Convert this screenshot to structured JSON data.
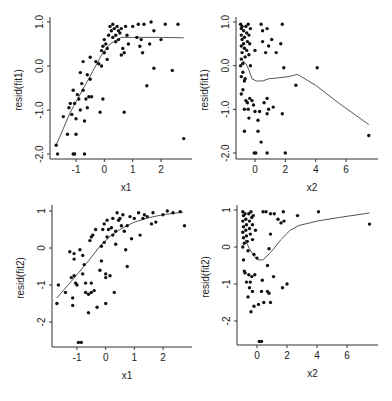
{
  "chart_data": [
    {
      "id": "p1",
      "type": "scatter",
      "xlabel": "x1",
      "ylabel": "resid(fit1)",
      "xlim": [
        -1.9,
        2.9
      ],
      "ylim": [
        -2.1,
        1.05
      ],
      "xticks": [
        -1,
        0,
        1,
        2
      ],
      "xtick_labels": [
        "-1",
        "0",
        "1",
        "2"
      ],
      "yticks": [
        -2,
        -1,
        0,
        1
      ],
      "ytick_labels": [
        "-2.0",
        "-1.0",
        "0.0",
        "1.0"
      ],
      "points": [
        [
          -1.7,
          -1.8
        ],
        [
          -1.65,
          -2.0
        ],
        [
          -1.45,
          -1.15
        ],
        [
          -1.3,
          -1.55
        ],
        [
          -1.25,
          -0.95
        ],
        [
          -1.2,
          -0.85
        ],
        [
          -1.15,
          -1.1
        ],
        [
          -1.1,
          -0.55
        ],
        [
          -1.1,
          -2.0
        ],
        [
          -1.05,
          -2.0
        ],
        [
          -1.05,
          -0.85
        ],
        [
          -1.0,
          -1.2
        ],
        [
          -1.0,
          -1.55
        ],
        [
          -0.95,
          -0.65
        ],
        [
          -0.9,
          -0.75
        ],
        [
          -0.85,
          -1.0
        ],
        [
          -0.85,
          -0.15
        ],
        [
          -0.8,
          -0.4
        ],
        [
          -0.75,
          -0.55
        ],
        [
          -0.75,
          0.1
        ],
        [
          -0.7,
          -1.25
        ],
        [
          -0.7,
          -2.0
        ],
        [
          -0.65,
          -0.75
        ],
        [
          -0.6,
          -0.2
        ],
        [
          -0.6,
          -0.95
        ],
        [
          -0.55,
          -0.7
        ],
        [
          -0.5,
          -0.3
        ],
        [
          -0.5,
          0.2
        ],
        [
          -0.45,
          -0.7
        ],
        [
          -0.3,
          0.1
        ],
        [
          -0.2,
          0.05
        ],
        [
          -0.15,
          -1.05
        ],
        [
          -0.1,
          0.35
        ],
        [
          -0.1,
          0.0
        ],
        [
          -0.05,
          0.45
        ],
        [
          -0.05,
          -0.75
        ],
        [
          0.0,
          0.3
        ],
        [
          0.0,
          0.6
        ],
        [
          0.05,
          0.5
        ],
        [
          0.1,
          0.15
        ],
        [
          0.1,
          0.4
        ],
        [
          0.15,
          0.7
        ],
        [
          0.2,
          0.9
        ],
        [
          0.25,
          0.8
        ],
        [
          0.3,
          0.95
        ],
        [
          0.3,
          0.65
        ],
        [
          0.35,
          0.85
        ],
        [
          0.4,
          0.7
        ],
        [
          0.4,
          0.55
        ],
        [
          0.45,
          0.9
        ],
        [
          0.5,
          0.6
        ],
        [
          0.5,
          0.8
        ],
        [
          0.55,
          0.75
        ],
        [
          0.6,
          0.25
        ],
        [
          0.6,
          0.85
        ],
        [
          0.65,
          0.4
        ],
        [
          0.7,
          0.3
        ],
        [
          0.7,
          -1.05
        ],
        [
          0.75,
          0.9
        ],
        [
          0.8,
          0.7
        ],
        [
          0.85,
          0.5
        ],
        [
          1.0,
          0.9
        ],
        [
          1.15,
          0.65
        ],
        [
          1.2,
          0.95
        ],
        [
          1.25,
          0.45
        ],
        [
          1.3,
          0.6
        ],
        [
          1.35,
          0.3
        ],
        [
          1.4,
          0.95
        ],
        [
          1.5,
          -0.45
        ],
        [
          1.6,
          0.5
        ],
        [
          1.65,
          1.0
        ],
        [
          1.75,
          0.8
        ],
        [
          1.75,
          -0.05
        ],
        [
          2.0,
          0.6
        ],
        [
          2.15,
          0.95
        ],
        [
          2.4,
          -0.1
        ],
        [
          2.6,
          0.95
        ],
        [
          2.8,
          -1.65
        ]
      ],
      "smooth": [
        [
          -1.7,
          -1.8
        ],
        [
          -1.2,
          -1.05
        ],
        [
          -0.6,
          -0.35
        ],
        [
          -0.1,
          0.25
        ],
        [
          0.2,
          0.5
        ],
        [
          0.6,
          0.65
        ],
        [
          1.0,
          0.65
        ],
        [
          2.0,
          0.65
        ],
        [
          2.8,
          0.64
        ]
      ]
    },
    {
      "id": "p2",
      "type": "scatter",
      "xlabel": "x2",
      "ylabel": "resid(fit1)",
      "xlim": [
        -1.2,
        7.8
      ],
      "ylim": [
        -2.1,
        1.05
      ],
      "xticks": [
        0,
        2,
        4,
        6
      ],
      "xtick_labels": [
        "0",
        "2",
        "4",
        "6"
      ],
      "yticks": [
        -2,
        -1,
        0,
        1
      ],
      "ytick_labels": [
        "-2.0",
        "-1.0",
        "0.0",
        "1.0"
      ],
      "points": [
        [
          -0.95,
          0.95
        ],
        [
          -0.9,
          0.85
        ],
        [
          -0.9,
          0.7
        ],
        [
          -0.85,
          0.6
        ],
        [
          -0.9,
          0.45
        ],
        [
          -0.85,
          0.3
        ],
        [
          -0.9,
          0.15
        ],
        [
          -0.8,
          0.05
        ],
        [
          -0.95,
          0.0
        ],
        [
          -0.85,
          0.9
        ],
        [
          -0.75,
          0.8
        ],
        [
          -0.7,
          0.65
        ],
        [
          -0.75,
          0.5
        ],
        [
          -0.7,
          0.4
        ],
        [
          -0.65,
          0.2
        ],
        [
          -0.6,
          0.9
        ],
        [
          -0.55,
          0.75
        ],
        [
          -0.5,
          0.55
        ],
        [
          -0.55,
          0.35
        ],
        [
          -0.45,
          0.95
        ],
        [
          -0.4,
          0.7
        ],
        [
          -0.35,
          0.5
        ],
        [
          -0.3,
          0.85
        ],
        [
          -0.4,
          0.25
        ],
        [
          -0.3,
          0.0
        ],
        [
          -0.9,
          -0.25
        ],
        [
          -0.8,
          -0.15
        ],
        [
          -0.7,
          -0.35
        ],
        [
          -0.65,
          -0.3
        ],
        [
          -0.9,
          -0.65
        ],
        [
          -0.8,
          -0.55
        ],
        [
          -0.7,
          -1.0
        ],
        [
          -0.6,
          -0.8
        ],
        [
          -0.5,
          -0.85
        ],
        [
          -0.45,
          -1.0
        ],
        [
          -0.4,
          -1.2
        ],
        [
          -0.35,
          -0.75
        ],
        [
          -0.2,
          -0.8
        ],
        [
          -0.1,
          -0.9
        ],
        [
          0.0,
          -1.05
        ],
        [
          -0.7,
          -1.5
        ],
        [
          0.2,
          -1.25
        ],
        [
          0.3,
          -1.05
        ],
        [
          0.2,
          -1.5
        ],
        [
          0.4,
          -1.75
        ],
        [
          -0.05,
          -2.0
        ],
        [
          0.05,
          -2.0
        ],
        [
          0.8,
          -2.0
        ],
        [
          2.0,
          -2.0
        ],
        [
          0.0,
          0.35
        ],
        [
          0.4,
          0.95
        ],
        [
          0.5,
          0.8
        ],
        [
          0.5,
          0.55
        ],
        [
          0.7,
          0.3
        ],
        [
          0.8,
          0.85
        ],
        [
          0.9,
          0.45
        ],
        [
          1.1,
          0.6
        ],
        [
          1.4,
          0.3
        ],
        [
          1.7,
          0.5
        ],
        [
          1.8,
          0.95
        ],
        [
          1.9,
          -0.05
        ],
        [
          0.6,
          -0.85
        ],
        [
          0.8,
          -0.75
        ],
        [
          0.8,
          -1.1
        ],
        [
          0.9,
          -1.0
        ],
        [
          1.2,
          -0.95
        ],
        [
          1.8,
          -1.1
        ],
        [
          2.7,
          -0.45
        ],
        [
          4.1,
          -0.05
        ],
        [
          7.5,
          -1.6
        ]
      ],
      "smooth": [
        [
          -0.9,
          0.15
        ],
        [
          -0.6,
          0.05
        ],
        [
          -0.4,
          -0.1
        ],
        [
          -0.2,
          -0.3
        ],
        [
          0.1,
          -0.35
        ],
        [
          0.5,
          -0.35
        ],
        [
          0.9,
          -0.3
        ],
        [
          1.5,
          -0.28
        ],
        [
          2.2,
          -0.25
        ],
        [
          2.8,
          -0.2
        ],
        [
          4.0,
          -0.45
        ],
        [
          5.5,
          -0.85
        ],
        [
          7.5,
          -1.35
        ]
      ]
    },
    {
      "id": "p3",
      "type": "scatter",
      "xlabel": "x1",
      "ylabel": "resid(fit2)",
      "xlim": [
        -1.9,
        2.9
      ],
      "ylim": [
        -2.7,
        1.1
      ],
      "xticks": [
        -1,
        0,
        1,
        2
      ],
      "xtick_labels": [
        "-1",
        "0",
        "1",
        "2"
      ],
      "yticks": [
        -2,
        -1,
        0,
        1
      ],
      "ytick_labels": [
        "-2",
        "-1",
        "0",
        "1"
      ],
      "points": [
        [
          -1.7,
          -1.5
        ],
        [
          -1.65,
          -1.0
        ],
        [
          -1.4,
          -1.2
        ],
        [
          -1.25,
          -0.1
        ],
        [
          -1.2,
          -0.8
        ],
        [
          -1.15,
          -1.35
        ],
        [
          -1.15,
          -1.55
        ],
        [
          -1.1,
          -0.15
        ],
        [
          -1.1,
          -0.75
        ],
        [
          -1.1,
          -0.3
        ],
        [
          -1.05,
          -0.95
        ],
        [
          -1.0,
          -1.0
        ],
        [
          -0.95,
          -2.55
        ],
        [
          -0.9,
          -0.05
        ],
        [
          -0.85,
          -2.55
        ],
        [
          -0.8,
          -0.7
        ],
        [
          -0.8,
          -0.2
        ],
        [
          -0.75,
          -0.45
        ],
        [
          -0.7,
          -1.2
        ],
        [
          -0.7,
          -0.95
        ],
        [
          -0.6,
          -1.25
        ],
        [
          -0.6,
          -1.75
        ],
        [
          -0.55,
          0.2
        ],
        [
          -0.5,
          0.3
        ],
        [
          -0.5,
          -1.2
        ],
        [
          -0.5,
          -0.95
        ],
        [
          -0.45,
          0.35
        ],
        [
          -0.4,
          -1.15
        ],
        [
          -0.35,
          0.5
        ],
        [
          -0.3,
          -1.6
        ],
        [
          -0.2,
          -0.6
        ],
        [
          -0.15,
          0.05
        ],
        [
          -0.15,
          -0.35
        ],
        [
          -0.1,
          0.5
        ],
        [
          -0.05,
          0.65
        ],
        [
          -0.05,
          0.15
        ],
        [
          0.0,
          -0.7
        ],
        [
          0.0,
          -0.8
        ],
        [
          0.0,
          -1.5
        ],
        [
          0.05,
          0.3
        ],
        [
          0.05,
          0.75
        ],
        [
          0.1,
          0.5
        ],
        [
          0.15,
          -0.75
        ],
        [
          0.2,
          0.55
        ],
        [
          0.25,
          0.35
        ],
        [
          0.25,
          0.8
        ],
        [
          0.3,
          -1.2
        ],
        [
          0.35,
          0.45
        ],
        [
          0.35,
          0.1
        ],
        [
          0.4,
          0.95
        ],
        [
          0.45,
          0.75
        ],
        [
          0.5,
          0.8
        ],
        [
          0.55,
          0.6
        ],
        [
          0.6,
          0.9
        ],
        [
          0.65,
          0.45
        ],
        [
          0.7,
          -0.05
        ],
        [
          0.75,
          0.6
        ],
        [
          0.75,
          -0.5
        ],
        [
          0.85,
          0.85
        ],
        [
          0.9,
          0.25
        ],
        [
          1.0,
          0.8
        ],
        [
          1.15,
          0.95
        ],
        [
          1.2,
          0.35
        ],
        [
          1.3,
          0.8
        ],
        [
          1.35,
          0.9
        ],
        [
          1.45,
          0.85
        ],
        [
          1.6,
          0.65
        ],
        [
          1.65,
          0.95
        ],
        [
          1.75,
          0.7
        ],
        [
          2.0,
          0.9
        ],
        [
          2.15,
          1.0
        ],
        [
          2.35,
          0.95
        ],
        [
          2.6,
          0.98
        ],
        [
          2.75,
          0.6
        ]
      ],
      "smooth": [
        [
          -1.7,
          -1.35
        ],
        [
          -1.2,
          -0.9
        ],
        [
          -0.6,
          -0.35
        ],
        [
          -0.2,
          0.05
        ],
        [
          0.2,
          0.35
        ],
        [
          0.6,
          0.55
        ],
        [
          1.0,
          0.7
        ],
        [
          1.5,
          0.82
        ],
        [
          2.0,
          0.9
        ],
        [
          2.7,
          0.97
        ]
      ]
    },
    {
      "id": "p4",
      "type": "scatter",
      "xlabel": "x2",
      "ylabel": "resid(fit2)",
      "xlim": [
        -1.2,
        7.8
      ],
      "ylim": [
        -2.7,
        1.1
      ],
      "xticks": [
        0,
        2,
        4,
        6
      ],
      "xtick_labels": [
        "0",
        "2",
        "4",
        "6"
      ],
      "yticks": [
        -2,
        -1,
        0,
        1
      ],
      "ytick_labels": [
        "-2",
        "-1",
        "0",
        "1"
      ],
      "points": [
        [
          -0.95,
          0.95
        ],
        [
          -0.9,
          0.85
        ],
        [
          -0.95,
          0.7
        ],
        [
          -0.9,
          0.55
        ],
        [
          -0.95,
          0.4
        ],
        [
          -0.9,
          0.25
        ],
        [
          -0.85,
          0.1
        ],
        [
          -0.95,
          0.0
        ],
        [
          -0.8,
          0.9
        ],
        [
          -0.75,
          0.75
        ],
        [
          -0.7,
          0.6
        ],
        [
          -0.75,
          0.45
        ],
        [
          -0.7,
          0.3
        ],
        [
          -0.65,
          0.15
        ],
        [
          -0.6,
          -0.1
        ],
        [
          -0.55,
          0.9
        ],
        [
          -0.5,
          0.7
        ],
        [
          -0.5,
          0.5
        ],
        [
          -0.45,
          0.35
        ],
        [
          -0.4,
          0.95
        ],
        [
          -0.35,
          0.8
        ],
        [
          -0.3,
          0.6
        ],
        [
          -0.25,
          0.85
        ],
        [
          -0.3,
          0.2
        ],
        [
          -0.2,
          -0.2
        ],
        [
          -0.1,
          0.45
        ],
        [
          0.0,
          -0.3
        ],
        [
          -0.9,
          -0.35
        ],
        [
          -0.85,
          -0.65
        ],
        [
          -0.8,
          -0.7
        ],
        [
          -0.7,
          -0.95
        ],
        [
          -0.6,
          -1.35
        ],
        [
          -0.55,
          -0.75
        ],
        [
          -0.5,
          -1.1
        ],
        [
          -0.45,
          -0.95
        ],
        [
          -0.35,
          -0.8
        ],
        [
          -0.3,
          -1.2
        ],
        [
          -0.2,
          -1.6
        ],
        [
          -0.15,
          -0.75
        ],
        [
          -0.4,
          -1.75
        ],
        [
          0.1,
          -1.55
        ],
        [
          0.3,
          -1.2
        ],
        [
          0.35,
          -0.9
        ],
        [
          0.45,
          -1.5
        ],
        [
          0.7,
          -1.2
        ],
        [
          0.8,
          -1.25
        ],
        [
          0.7,
          -0.5
        ],
        [
          0.9,
          -1.5
        ],
        [
          1.1,
          -0.8
        ],
        [
          0.15,
          -2.55
        ],
        [
          0.3,
          -2.55
        ],
        [
          0.4,
          0.95
        ],
        [
          0.6,
          0.95
        ],
        [
          0.9,
          0.9
        ],
        [
          0.9,
          0.35
        ],
        [
          1.15,
          0.9
        ],
        [
          1.4,
          0.75
        ],
        [
          1.6,
          0.65
        ],
        [
          1.75,
          0.95
        ],
        [
          1.8,
          0.7
        ],
        [
          1.7,
          -1.1
        ],
        [
          2.0,
          -1.0
        ],
        [
          0.8,
          -0.05
        ],
        [
          2.7,
          0.85
        ],
        [
          4.1,
          0.95
        ],
        [
          7.5,
          0.62
        ]
      ],
      "smooth": [
        [
          -0.8,
          0.2
        ],
        [
          -0.5,
          -0.05
        ],
        [
          -0.2,
          -0.25
        ],
        [
          0.1,
          -0.35
        ],
        [
          0.4,
          -0.35
        ],
        [
          0.9,
          -0.15
        ],
        [
          1.6,
          0.2
        ],
        [
          2.2,
          0.45
        ],
        [
          2.8,
          0.58
        ],
        [
          4.0,
          0.7
        ],
        [
          5.5,
          0.8
        ],
        [
          7.5,
          0.92
        ]
      ]
    }
  ]
}
